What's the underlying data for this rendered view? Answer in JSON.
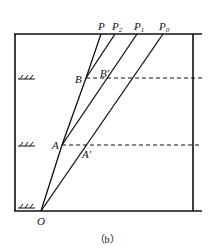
{
  "diagram": {
    "caption": "（b）",
    "points": {
      "O": "O",
      "A": "A",
      "A_prime": "A′",
      "B": "B",
      "B_prime": "B′"
    },
    "top_labels": [
      {
        "base": "P",
        "sub": ""
      },
      {
        "base": "P",
        "sub": "2"
      },
      {
        "base": "P",
        "sub": "1"
      },
      {
        "base": "P",
        "sub": "0"
      }
    ],
    "levels": [
      "ground-level-B",
      "ground-level-A",
      "ground-level-O"
    ]
  }
}
